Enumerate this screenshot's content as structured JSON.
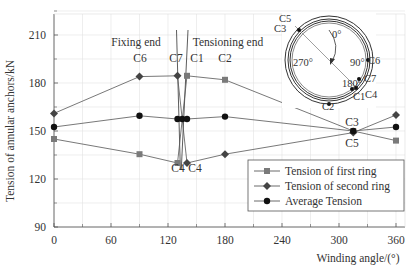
{
  "chart_data": {
    "type": "line",
    "title": "",
    "xlabel": "Winding angle/(°)",
    "ylabel": "Tension of annular anchors/kN",
    "xlim": [
      0,
      370
    ],
    "ylim": [
      90,
      225
    ],
    "xticks": [
      0,
      60,
      120,
      180,
      240,
      300,
      360
    ],
    "yticks": [
      90,
      120,
      150,
      180,
      210
    ],
    "grid": true,
    "legend_position": "lower right",
    "series": [
      {
        "name": "Tension of first ring",
        "marker": "square",
        "color": "#7a7a7a",
        "points": [
          [
            0,
            145
          ],
          [
            90,
            135.5
          ],
          [
            130,
            130
          ],
          [
            140,
            184.5
          ],
          [
            180,
            182
          ],
          [
            315,
            150
          ],
          [
            360,
            144
          ]
        ]
      },
      {
        "name": "Tension of second ring",
        "marker": "diamond",
        "color": "#444444",
        "points": [
          [
            0,
            161
          ],
          [
            90,
            184
          ],
          [
            130,
            184.5
          ],
          [
            140,
            130
          ],
          [
            180,
            135.5
          ],
          [
            315,
            149
          ],
          [
            360,
            160
          ]
        ]
      },
      {
        "name": "Average Tension",
        "marker": "circle",
        "color": "#111111",
        "points": [
          [
            0,
            152.5
          ],
          [
            90,
            159.5
          ],
          [
            130,
            157.5
          ],
          [
            135,
            157.5
          ],
          [
            140,
            157.5
          ],
          [
            180,
            159
          ],
          [
            315,
            150
          ],
          [
            360,
            152.5
          ]
        ]
      }
    ],
    "annotations": [
      {
        "text": "Fixing end",
        "x": 103,
        "y": 15
      },
      {
        "text": "Tensioning end",
        "x": 194,
        "y": 15
      },
      {
        "text": "C6",
        "x": 140,
        "y": 31
      },
      {
        "text": "C7",
        "x": 176,
        "y": 31
      },
      {
        "text": "C1",
        "x": 197,
        "y": 31
      },
      {
        "text": "C2",
        "x": 225,
        "y": 31
      },
      {
        "text": "C4",
        "x": 178,
        "y": 161
      },
      {
        "text": "C4",
        "x": 192,
        "y": 161
      },
      {
        "text": "C3",
        "x": 351,
        "y": 124
      },
      {
        "text": "C5",
        "x": 351,
        "y": 146
      }
    ],
    "inset": {
      "angles": [
        "0°",
        "90°",
        "180°",
        "270°"
      ],
      "labels": [
        "C1",
        "C2",
        "C3",
        "C4",
        "C5",
        "C6",
        "C7"
      ]
    }
  },
  "labels": {
    "xlabel": "Winding angle/(°)",
    "ylabel": "Tension of annular anchors/kN",
    "fixing_end": "Fixing end",
    "tensioning_end": "Tensioning end",
    "legend": [
      "Tension of first ring",
      "Tension of second ring",
      "Average Tension"
    ]
  }
}
